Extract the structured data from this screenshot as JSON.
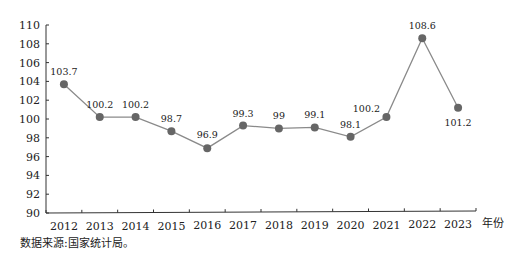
{
  "chart_data": {
    "type": "line",
    "title": "",
    "xlabel": "年份",
    "ylabel": "",
    "categories": [
      "2012",
      "2013",
      "2014",
      "2015",
      "2016",
      "2017",
      "2018",
      "2019",
      "2020",
      "2021",
      "2022",
      "2023"
    ],
    "values": [
      103.7,
      100.2,
      100.2,
      98.7,
      96.9,
      99.3,
      99,
      99.1,
      98.1,
      100.2,
      108.6,
      101.2
    ],
    "data_labels": [
      "103.7",
      "100.2",
      "100.2",
      "98.7",
      "96.9",
      "99.3",
      "99",
      "99.1",
      "98.1",
      "100.2",
      "108.6",
      "101.2"
    ],
    "ylim": [
      90,
      110
    ],
    "yticks": [
      90,
      92,
      94,
      96,
      98,
      100,
      102,
      104,
      106,
      108,
      110
    ],
    "grid": false,
    "legend": null,
    "line_color": "#8a8a8a",
    "marker_color": "#666666"
  },
  "source_note": "数据来源:国家统计局。"
}
